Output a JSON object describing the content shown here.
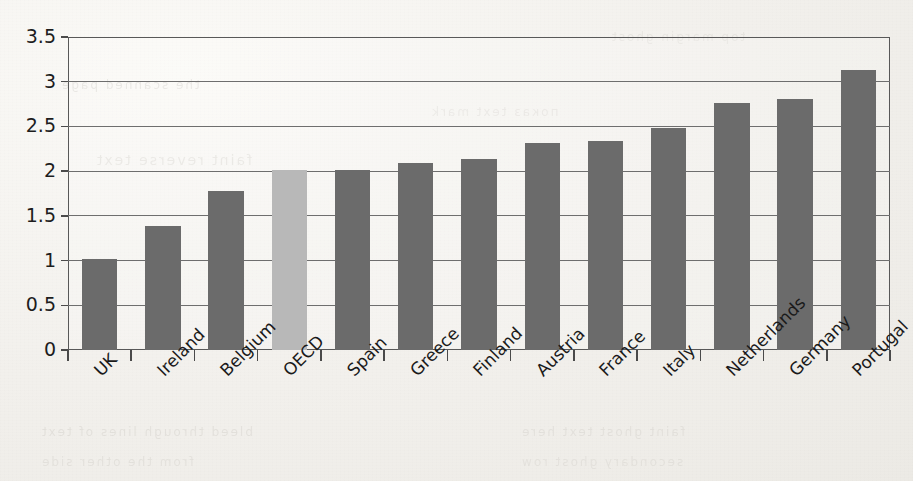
{
  "chart_data": {
    "type": "bar",
    "title": "",
    "subtitle": "",
    "xlabel": "",
    "ylabel": "",
    "categories": [
      "UK",
      "Ireland",
      "Belgium",
      "OECD",
      "Spain",
      "Greece",
      "Finland",
      "Austria",
      "France",
      "Italy",
      "Netherlands",
      "Germany",
      "Portugal"
    ],
    "values": [
      1.02,
      1.39,
      1.78,
      2.01,
      2.01,
      2.09,
      2.14,
      2.32,
      2.34,
      2.48,
      2.76,
      2.81,
      3.13
    ],
    "highlight_index": 3,
    "highlight_category": "OECD",
    "ylim": [
      0,
      3.5
    ],
    "yticks": [
      0,
      0.5,
      1,
      1.5,
      2,
      2.5,
      3,
      3.5
    ],
    "ytick_labels": [
      "0",
      "0.5",
      "1",
      "1.5",
      "2",
      "2.5",
      "3",
      "3.5"
    ],
    "grid": true,
    "legend": false,
    "legend_position": "none",
    "xtick_label_rotation": -45,
    "bar_color": "#6b6b6b",
    "highlight_bar_color": "#b8b8b8",
    "grid_color": "#6e6e6e",
    "frame_color": "#585858",
    "background_color": "#f4f2ee"
  },
  "bleed_through": {
    "line1": "the scanned page",
    "line2": "faint reverse text",
    "line3": "показ  text  mark",
    "line4": "bleed through lines of text",
    "line5": "from the other side",
    "line6": "faint ghost text here",
    "line7": "secondary ghost row",
    "line8": "top margin ghost"
  }
}
